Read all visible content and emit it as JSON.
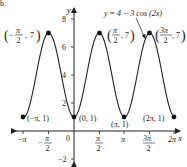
{
  "figure_label": "b.",
  "chart_data": {
    "type": "line",
    "title": "",
    "equation": "y = 4 − 3 cos (2x)",
    "xlabel": "x",
    "ylabel": "y",
    "xlim": [
      -3.4,
      6.6
    ],
    "ylim": [
      -2.6,
      8.6
    ],
    "x_ticks": [
      "−π",
      "−π/2",
      "0",
      "π/2",
      "π",
      "3π/2",
      "2π"
    ],
    "y_ticks": [
      "−2",
      "2",
      "4",
      "6",
      "8"
    ],
    "series": [
      {
        "name": "y = 4 − 3 cos (2x)",
        "domain": [
          "−π",
          "2π"
        ],
        "function": "4 - 3*cos(2x)"
      }
    ],
    "points": [
      {
        "label": "(−π, 1)",
        "x": -3.14159,
        "y": 1
      },
      {
        "label": "(−π/2, 7)",
        "x": -1.5708,
        "y": 7
      },
      {
        "label": "(0, 1)",
        "x": 0,
        "y": 1
      },
      {
        "label": "(π/2, 7)",
        "x": 1.5708,
        "y": 7
      },
      {
        "label": "(π, 1)",
        "x": 3.14159,
        "y": 1
      },
      {
        "label": "(3π/2, 7)",
        "x": 4.7124,
        "y": 7
      },
      {
        "label": "(2π, 1)",
        "x": 6.28318,
        "y": 1
      }
    ],
    "grid": false
  },
  "text": {
    "eq": "y = 4 − 3 cos (2x)",
    "xlab": "x",
    "ylab": "y",
    "y8": "8",
    "y6": "6",
    "y4": "4",
    "y2": "2",
    "yn2": "−2",
    "zero": "0",
    "xnpi": "−π",
    "xpi": "π",
    "x2pi": "2π",
    "pi": "π",
    "two": "2",
    "three_pi": "3π",
    "neg": "−",
    "p_npi": "(−π, 1)",
    "p_0": "(0, 1)",
    "p_pi": "(π, 1)",
    "p_2pi": "(2π, 1)",
    "seven": "7"
  }
}
